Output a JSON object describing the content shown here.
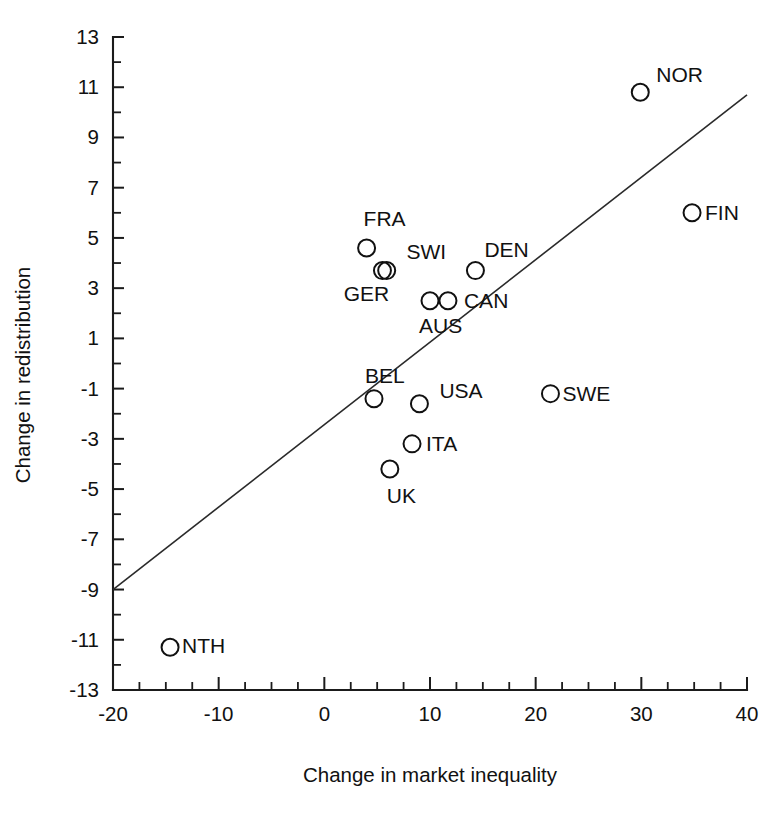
{
  "chart_data": {
    "type": "scatter",
    "title": "",
    "xlabel": "Change in market inequality",
    "ylabel": "Change in redistribution",
    "xlim": [
      -20,
      40
    ],
    "ylim": [
      -13,
      13
    ],
    "grid": false,
    "legend": "none",
    "x_ticks": [
      -20,
      -10,
      0,
      10,
      20,
      30,
      40
    ],
    "x_tick_labels": [
      "-20",
      "-10",
      "0",
      "10",
      "20",
      "30",
      "40"
    ],
    "x_minor_step": 2.5,
    "y_ticks": [
      -13,
      -11,
      -9,
      -7,
      -5,
      -3,
      -1,
      1,
      3,
      5,
      7,
      9,
      11,
      13
    ],
    "y_tick_labels": [
      "-13",
      "-11",
      "-9",
      "-7",
      "-5",
      "-3",
      "-1",
      "1",
      "3",
      "5",
      "7",
      "9",
      "11",
      "13"
    ],
    "y_minor_step": 1,
    "marker": "open-circle",
    "points": [
      {
        "label": "NOR",
        "x": 29.9,
        "y": 10.8,
        "label_dx": 16,
        "label_dy": -10
      },
      {
        "label": "FIN",
        "x": 34.8,
        "y": 6.0,
        "label_dx": 13,
        "label_dy": 7
      },
      {
        "label": "FRA",
        "x": 4.0,
        "y": 4.6,
        "label_dx": -3,
        "label_dy": -22
      },
      {
        "label": "SWI",
        "x": 5.5,
        "y": 3.7,
        "label_dx": 24,
        "label_dy": -12
      },
      {
        "label": "GER",
        "x": 5.9,
        "y": 3.7,
        "label_dx": -43,
        "label_dy": 30
      },
      {
        "label": "DEN",
        "x": 14.3,
        "y": 3.7,
        "label_dx": 9,
        "label_dy": -14
      },
      {
        "label": "AUS",
        "x": 10.0,
        "y": 2.5,
        "label_dx": -11,
        "label_dy": 32
      },
      {
        "label": "CAN",
        "x": 11.7,
        "y": 2.5,
        "label_dx": 16,
        "label_dy": 7
      },
      {
        "label": "BEL",
        "x": 4.7,
        "y": -1.4,
        "label_dx": -9,
        "label_dy": -16
      },
      {
        "label": "USA",
        "x": 9.0,
        "y": -1.6,
        "label_dx": 20,
        "label_dy": -6
      },
      {
        "label": "SWE",
        "x": 21.4,
        "y": -1.2,
        "label_dx": 12,
        "label_dy": 7
      },
      {
        "label": "ITA",
        "x": 8.3,
        "y": -3.2,
        "label_dx": 14,
        "label_dy": 7
      },
      {
        "label": "UK",
        "x": 6.2,
        "y": -4.2,
        "label_dx": -3,
        "label_dy": 34
      },
      {
        "label": "NTH",
        "x": -14.6,
        "y": -11.3,
        "label_dx": 12,
        "label_dy": 6
      }
    ],
    "fit_line": {
      "name": "regression-line",
      "x_start": -20,
      "y_start": -9.0,
      "x_end": 40,
      "y_end": 10.7
    }
  },
  "colors": {
    "ink": "#111111",
    "background": "#ffffff"
  }
}
